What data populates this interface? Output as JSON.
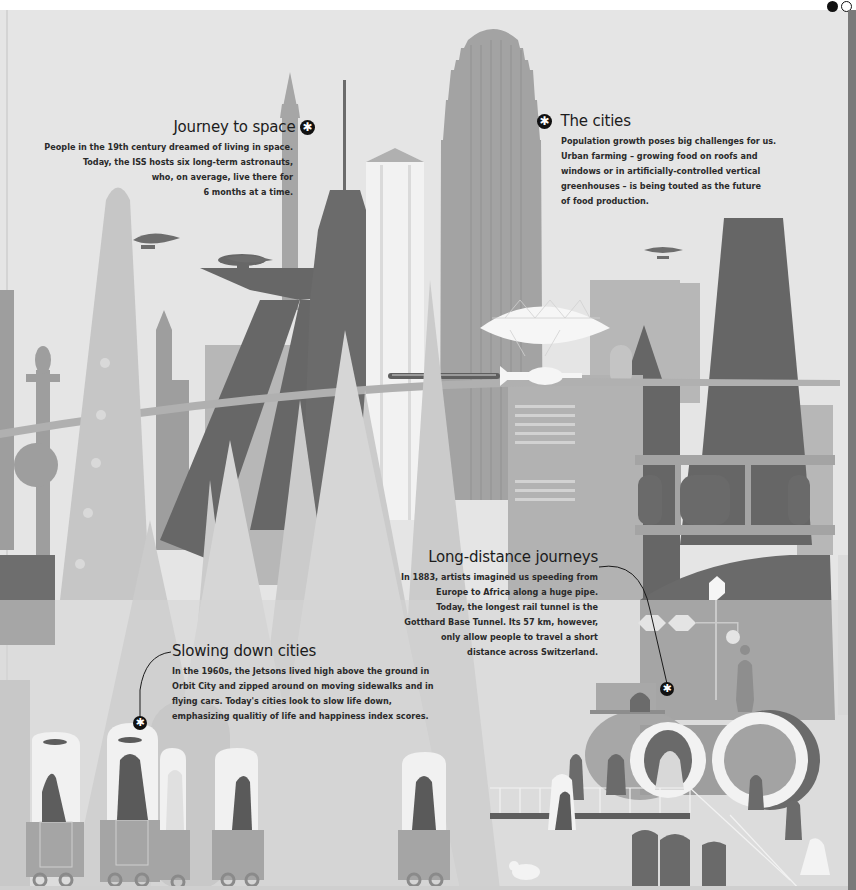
{
  "pager": {
    "dots": [
      {
        "state": "active"
      },
      {
        "state": "inactive"
      }
    ]
  },
  "callouts": {
    "journey_to_space": {
      "title": "Journey to space",
      "icon": "asterisk-bullet-icon",
      "body_lines": [
        "People in the 19th century dreamed of living in space.",
        "Today, the ISS hosts six long-term astronauts,",
        "who, on average, live there for",
        "6 months at a time."
      ]
    },
    "the_cities": {
      "title": "The cities",
      "icon": "asterisk-bullet-icon",
      "body_lines": [
        "Population growth poses big challenges for us.",
        "Urban farming – growing food on roofs and",
        "windows or in artificially-controlled vertical",
        "greenhouses – is being touted as the future",
        "of food production."
      ]
    },
    "long_distance": {
      "title": "Long-distance journeys",
      "icon": "asterisk-pin-icon",
      "body_lines": [
        "In 1883, artists imagined us speeding from",
        "Europe to Africa along a huge pipe.",
        "Today, the longest rail tunnel is the",
        "Gotthard Base Tunnel. Its 57 km, however,",
        "only allow people to travel a short",
        "distance across Switzerland."
      ]
    },
    "slowing_down": {
      "title": "Slowing down cities",
      "icon": "asterisk-pin-icon",
      "body_lines": [
        "In the 1960s, the Jetsons lived high above the ground in",
        "Orbit City and zipped around on moving sidewalks and in",
        "flying cars. Today's cities look to slow life down,",
        "emphasizing qualitiy of life and happiness index scores."
      ]
    }
  },
  "glyphs": {
    "asterisk": "✱"
  },
  "palette": {
    "sky": "#e6e6e6",
    "light": "#cfcfcf",
    "mid": "#a9a9a9",
    "dark": "#6f6f6f",
    "darker": "#5c5c5c",
    "ink": "#111111",
    "white": "#f7f7f7"
  }
}
